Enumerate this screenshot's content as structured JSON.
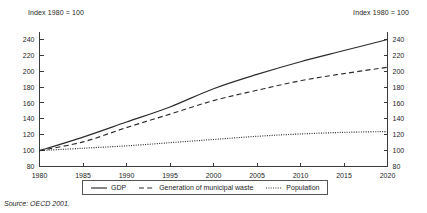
{
  "notes": {
    "left_axis_note": "Index 1980 = 100",
    "right_axis_note": "Index 1980 = 100"
  },
  "source": {
    "text": "Source: OECD 2001."
  },
  "legend": {
    "items": [
      {
        "label": "GDP",
        "style": "solid",
        "color": "#2b2b2b"
      },
      {
        "label": "Generation of municipal waste",
        "style": "dashed",
        "color": "#2b2b2b"
      },
      {
        "label": "Population",
        "style": "dotted",
        "color": "#2b2b2b"
      }
    ]
  },
  "chart_data": {
    "type": "line",
    "title": "",
    "subtitle": "",
    "xlabel": "",
    "ylabel": "Index 1980 = 100",
    "xlim": [
      1980,
      2020
    ],
    "ylim": [
      80,
      250
    ],
    "grid": false,
    "legend_position": "bottom",
    "xticks": [
      1980,
      1985,
      1990,
      1995,
      2000,
      2005,
      2010,
      2015,
      2020
    ],
    "yticks": [
      80,
      100,
      120,
      140,
      160,
      180,
      200,
      220,
      240
    ],
    "right_axis_yticks": [
      80,
      100,
      120,
      140,
      160,
      180,
      200,
      220,
      240
    ],
    "x": [
      1980,
      1985,
      1990,
      1995,
      2000,
      2005,
      2010,
      2015,
      2020
    ],
    "series": [
      {
        "name": "GDP",
        "style": "solid",
        "values": [
          100,
          117,
          136,
          155,
          178,
          196,
          212,
          226,
          240
        ]
      },
      {
        "name": "Generation of municipal waste",
        "style": "dashed",
        "values": [
          100,
          111,
          129,
          146,
          163,
          176,
          188,
          197,
          205
        ]
      },
      {
        "name": "Population",
        "style": "dotted",
        "values": [
          100,
          103,
          106,
          110,
          114,
          118,
          121,
          123,
          124
        ]
      }
    ]
  }
}
